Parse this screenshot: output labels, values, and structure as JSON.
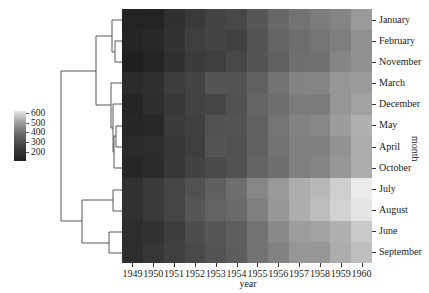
{
  "chart_data": {
    "type": "heatmap",
    "title": "",
    "xlabel": "year",
    "ylabel": "month",
    "colormap": "grayscale (dark = low, light = high)",
    "colorbar": {
      "ticks": [
        200,
        300,
        400,
        500,
        600
      ],
      "range": [
        104,
        622
      ]
    },
    "row_dendrogram": true,
    "col_dendrogram": false,
    "categories_x": [
      "1949",
      "1950",
      "1951",
      "1952",
      "1953",
      "1954",
      "1955",
      "1956",
      "1957",
      "1958",
      "1959",
      "1960"
    ],
    "categories_y": [
      "January",
      "February",
      "November",
      "March",
      "December",
      "May",
      "April",
      "October",
      "July",
      "August",
      "June",
      "September"
    ],
    "values": [
      [
        112,
        115,
        145,
        171,
        196,
        204,
        242,
        284,
        315,
        340,
        360,
        417
      ],
      [
        118,
        126,
        150,
        180,
        196,
        188,
        233,
        277,
        301,
        318,
        342,
        391
      ],
      [
        104,
        114,
        146,
        172,
        180,
        203,
        237,
        271,
        305,
        310,
        362,
        390
      ],
      [
        132,
        141,
        178,
        193,
        236,
        235,
        267,
        317,
        356,
        362,
        406,
        419
      ],
      [
        118,
        140,
        166,
        194,
        201,
        229,
        278,
        306,
        336,
        337,
        405,
        432
      ],
      [
        121,
        125,
        172,
        183,
        229,
        234,
        270,
        318,
        355,
        363,
        420,
        472
      ],
      [
        129,
        135,
        163,
        181,
        235,
        227,
        269,
        313,
        348,
        348,
        396,
        461
      ],
      [
        119,
        133,
        162,
        191,
        211,
        229,
        274,
        306,
        347,
        359,
        407,
        461
      ],
      [
        148,
        170,
        199,
        230,
        264,
        302,
        364,
        413,
        465,
        491,
        548,
        622
      ],
      [
        148,
        170,
        199,
        242,
        272,
        293,
        347,
        405,
        467,
        505,
        559,
        606
      ],
      [
        135,
        149,
        178,
        218,
        243,
        264,
        315,
        374,
        422,
        435,
        472,
        535
      ],
      [
        136,
        158,
        184,
        209,
        237,
        259,
        312,
        355,
        404,
        404,
        463,
        508
      ]
    ]
  },
  "labels": {
    "x_title": "year",
    "y_title": "month",
    "x_ticks": [
      "1949",
      "1950",
      "1951",
      "1952",
      "1953",
      "1954",
      "1955",
      "1956",
      "1957",
      "1958",
      "1959",
      "1960"
    ],
    "y_ticks": [
      "January",
      "February",
      "November",
      "March",
      "December",
      "May",
      "April",
      "October",
      "July",
      "August",
      "June",
      "September"
    ],
    "colorbar_ticks": [
      "600",
      "500",
      "400",
      "300",
      "200"
    ]
  }
}
